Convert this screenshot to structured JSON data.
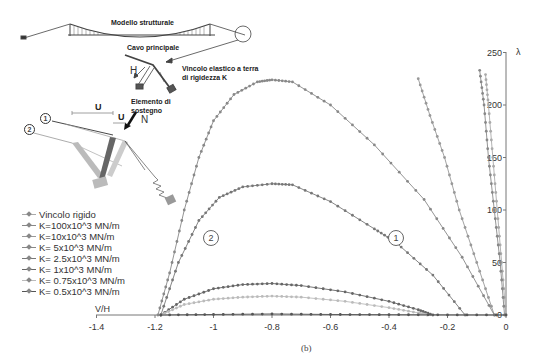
{
  "figure": {
    "caption": "(b)",
    "inset_labels": {
      "structural_model": "Modello strutturale",
      "main_cable": "Cavo principale",
      "elastic_support": "Vincolo elastico a terra",
      "elastic_support_2": "di rigidezza K",
      "support_element": "Elemento di",
      "support_element_2": "sostegno",
      "H": "H",
      "N": "N",
      "U_big": "U",
      "U_small": "U",
      "config_1": "1",
      "config_2": "2"
    },
    "curve_markers": {
      "marker_1": "1",
      "marker_2": "2"
    }
  },
  "chart_data": {
    "type": "line",
    "title": "",
    "xlabel": "V/H",
    "ylabel": "λ",
    "xlim": [
      -1.4,
      0
    ],
    "ylim": [
      0,
      250
    ],
    "xticks": [
      "-1.4",
      "-1.2",
      "-1",
      "-0.8",
      "-0.6",
      "-0.4",
      "-0.2",
      "0"
    ],
    "yticks": [
      "0",
      "50",
      "100",
      "150",
      "200",
      "250"
    ],
    "grid": false,
    "legend_position": "left",
    "series": [
      {
        "name": "Vincolo rigido",
        "color": "#aaaaaa",
        "points": [
          [
            -0.07,
            229
          ],
          [
            -0.06,
            200
          ],
          [
            -0.045,
            150
          ],
          [
            -0.03,
            100
          ],
          [
            -0.015,
            50
          ],
          [
            0,
            0
          ]
        ]
      },
      {
        "name": "K=100x10^3 MN/m",
        "color": "#888888",
        "points": [
          [
            -0.09,
            233
          ],
          [
            -0.075,
            200
          ],
          [
            -0.06,
            150
          ],
          [
            -0.04,
            100
          ],
          [
            -0.02,
            50
          ],
          [
            -0.005,
            0
          ]
        ]
      },
      {
        "name": "K=10x10^3 MN/m",
        "color": "#999999",
        "points": [
          [
            -0.3,
            225
          ],
          [
            -0.26,
            190
          ],
          [
            -0.21,
            150
          ],
          [
            -0.16,
            100
          ],
          [
            -0.1,
            50
          ],
          [
            -0.04,
            0
          ]
        ]
      },
      {
        "name": "K= 5x10^3 MN/m",
        "color": "#888888",
        "points": [
          [
            -1.19,
            0
          ],
          [
            -1.15,
            40
          ],
          [
            -1.1,
            100
          ],
          [
            -1.05,
            150
          ],
          [
            -1.0,
            185
          ],
          [
            -0.93,
            210
          ],
          [
            -0.85,
            222
          ],
          [
            -0.8,
            224
          ],
          [
            -0.73,
            222
          ],
          [
            -0.6,
            200
          ],
          [
            -0.45,
            162
          ],
          [
            -0.28,
            110
          ],
          [
            -0.15,
            55
          ],
          [
            -0.04,
            0
          ]
        ]
      },
      {
        "name": "K= 2.5x10^3 MN/m",
        "color": "#777777",
        "points": [
          [
            -1.18,
            0
          ],
          [
            -1.12,
            50
          ],
          [
            -1.05,
            90
          ],
          [
            -0.98,
            112
          ],
          [
            -0.9,
            122
          ],
          [
            -0.8,
            125
          ],
          [
            -0.73,
            124
          ],
          [
            -0.6,
            108
          ],
          [
            -0.45,
            82
          ],
          [
            -0.38,
            70
          ],
          [
            -0.25,
            38
          ],
          [
            -0.14,
            0
          ]
        ]
      },
      {
        "name": "K= 1x10^3 MN/m",
        "color": "#666666",
        "points": [
          [
            -1.18,
            0
          ],
          [
            -1.1,
            15
          ],
          [
            -1.0,
            25
          ],
          [
            -0.9,
            29
          ],
          [
            -0.8,
            30
          ],
          [
            -0.7,
            28
          ],
          [
            -0.55,
            22
          ],
          [
            -0.4,
            13
          ],
          [
            -0.3,
            5
          ],
          [
            -0.25,
            0
          ]
        ]
      },
      {
        "name": "K= 0.75x10^3 MN/m",
        "color": "#bbbbbb",
        "points": [
          [
            -1.18,
            0
          ],
          [
            -1.1,
            10
          ],
          [
            -1.0,
            15
          ],
          [
            -0.9,
            17
          ],
          [
            -0.8,
            18
          ],
          [
            -0.7,
            17
          ],
          [
            -0.55,
            13
          ],
          [
            -0.4,
            7
          ],
          [
            -0.3,
            2
          ],
          [
            -0.27,
            0
          ]
        ]
      },
      {
        "name": "K= 0.5x10^3 MN/m",
        "color": "#555555",
        "points": [
          [
            -1.18,
            0
          ],
          [
            -1.0,
            0.5
          ],
          [
            -0.8,
            1
          ],
          [
            -0.6,
            0.5
          ],
          [
            -0.4,
            0.3
          ],
          [
            -0.2,
            0.1
          ],
          [
            0,
            0
          ]
        ]
      }
    ],
    "annotations": [
      {
        "text": "1",
        "x": -0.37,
        "y": 72
      },
      {
        "text": "2",
        "x": -1.03,
        "y": 72
      }
    ]
  }
}
